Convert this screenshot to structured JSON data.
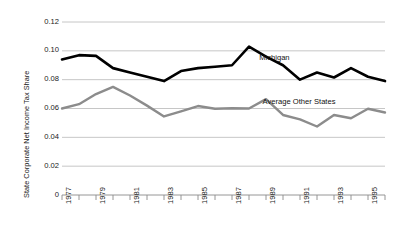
{
  "chart_data": {
    "type": "line",
    "title": "",
    "xlabel": "",
    "ylabel": "State Corporate Net Income Tax Share",
    "x": [
      1977,
      1978,
      1979,
      1980,
      1981,
      1982,
      1983,
      1984,
      1985,
      1986,
      1987,
      1988,
      1989,
      1990,
      1991,
      1992,
      1993,
      1994,
      1995,
      1996
    ],
    "xlim": [
      1977,
      1996
    ],
    "ylim": [
      0,
      0.12
    ],
    "yticks": [
      0,
      0.02,
      0.04,
      0.06,
      0.08,
      0.1,
      0.12
    ],
    "ytick_labels": [
      "0",
      "0.02",
      "0.04",
      "0.06",
      "0.08",
      "0.10",
      "0.12"
    ],
    "xtick_labels": [
      "1977",
      "1979",
      "1981",
      "1983",
      "1985",
      "1987",
      "1989",
      "1991",
      "1993",
      "1995"
    ],
    "xticks_labeled": [
      1977,
      1979,
      1981,
      1983,
      1985,
      1987,
      1989,
      1991,
      1993,
      1995
    ],
    "grid": "horizontal",
    "legend": "inline-annotations",
    "series": [
      {
        "name": "Michigan",
        "color": "#000000",
        "width": 2.6,
        "values": [
          0.094,
          0.097,
          0.0965,
          0.088,
          0.085,
          0.082,
          0.079,
          0.086,
          0.088,
          0.089,
          0.09,
          0.103,
          0.096,
          0.09,
          0.08,
          0.085,
          0.0815,
          0.088,
          0.082,
          0.079
        ],
        "label_x": 1988.6,
        "label_y": 0.0955
      },
      {
        "name": "Average Other States",
        "color": "#8c8c8c",
        "width": 2.4,
        "values": [
          0.06,
          0.063,
          0.07,
          0.075,
          0.069,
          0.062,
          0.0545,
          0.058,
          0.0617,
          0.0598,
          0.0602,
          0.06,
          0.0665,
          0.0555,
          0.0525,
          0.0475,
          0.0555,
          0.0532,
          0.0598,
          0.0572
        ],
        "label_x": 1988.8,
        "label_y": 0.0655
      }
    ]
  },
  "axis": {
    "y_title": "State Corporate Net Income Tax Share"
  }
}
